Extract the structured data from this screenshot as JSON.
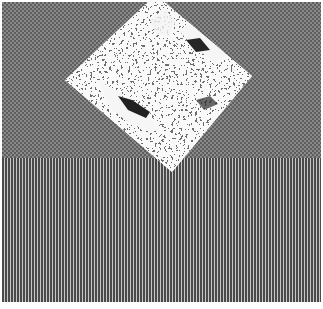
{
  "image": {
    "width": 323,
    "height": 309,
    "description": "Grayscale halftone image: checkerboard-textured upper region, vertical-stripe lower region, and a noisy speckled diamond shape overlapping the top region",
    "regions": [
      {
        "name": "checkerboard",
        "top": 2,
        "bottom": 158,
        "tone": "#757575"
      },
      {
        "name": "vertical-stripes",
        "top": 158,
        "bottom": 302,
        "tone": "#6f6f6f"
      }
    ],
    "diamond": {
      "vertices": {
        "top": [
          155,
          0
        ],
        "right": [
          252,
          76
        ],
        "bottom": [
          172,
          172
        ],
        "left": [
          65,
          80
        ]
      },
      "texture": "random black/white speckle noise with white patches",
      "colors": {
        "light": "#f4f4f4",
        "dark": "#2a2a2a",
        "mid": "#7a7a7a"
      }
    }
  }
}
